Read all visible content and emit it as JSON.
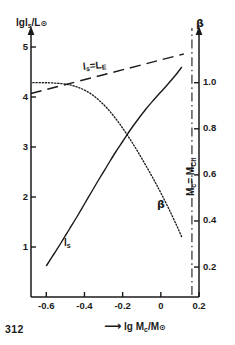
{
  "page": {
    "number": "312"
  },
  "axes": {
    "left": {
      "title_parts": {
        "lg": "lg",
        "l": "l",
        "sub": "s",
        "slash": "/L",
        "sun": "⊙"
      },
      "title": "lg ls/L⊙",
      "ticks": [
        1,
        2,
        3,
        4,
        5
      ],
      "tick_labels": [
        "1",
        "2",
        "3",
        "4",
        "5"
      ],
      "range": [
        0,
        5.3
      ]
    },
    "bottom": {
      "arrow": "⟶",
      "title_parts": {
        "lg": "lg M",
        "sub": "c",
        "slash": "/M",
        "sun": "⊙"
      },
      "title": "⟶ lg Mc/M⊙",
      "ticks": [
        -0.6,
        -0.4,
        -0.2,
        0,
        0.2
      ],
      "tick_labels": [
        "-0.6",
        "-0.4",
        "-0.2",
        "0",
        "0.2"
      ],
      "range": [
        -0.68,
        0.2
      ]
    },
    "right": {
      "title": "β",
      "ticks": [
        0.2,
        0.4,
        0.6,
        0.8,
        1.0
      ],
      "tick_labels": [
        "0.2",
        "0.4",
        "0.6",
        "0.8",
        "1.0"
      ],
      "range": [
        0.07,
        1.22
      ]
    }
  },
  "annotations": {
    "eddington": {
      "text": "lₛ = Lₑ",
      "parts": {
        "l": "l",
        "sub1": "s",
        "eq": "=L",
        "sub2": "E"
      }
    },
    "chandrasekhar": {
      "text": "Mᴄ = Mᴄʜ",
      "parts": {
        "m1": "M",
        "sub1": "c",
        "eq": "= M",
        "sub2": "Ch"
      }
    },
    "curve_ls": {
      "text": "lₛ",
      "parts": {
        "l": "l",
        "sub": "s"
      }
    },
    "curve_beta": {
      "text": "β"
    }
  },
  "chart_data": {
    "type": "line",
    "title": "",
    "xlabel": "lg Mc/M⊙",
    "ylabel": "lg ls/L⊙",
    "y2label": "β",
    "xlim": [
      -0.68,
      0.2
    ],
    "ylim": [
      0,
      5.3
    ],
    "y2lim": [
      0.07,
      1.22
    ],
    "grid": false,
    "legend": "none",
    "series": [
      {
        "name": "ls",
        "label": "lₛ",
        "axis": "left",
        "style": "solid",
        "color": "#1a1a1a",
        "x": [
          -0.6,
          -0.56,
          -0.52,
          -0.48,
          -0.44,
          -0.4,
          -0.36,
          -0.32,
          -0.28,
          -0.24,
          -0.2,
          -0.16,
          -0.12,
          -0.08,
          -0.04,
          0.0,
          0.04,
          0.08,
          0.11
        ],
        "y": [
          0.62,
          0.86,
          1.1,
          1.35,
          1.6,
          1.86,
          2.12,
          2.38,
          2.63,
          2.88,
          3.11,
          3.34,
          3.55,
          3.75,
          3.93,
          4.1,
          4.27,
          4.45,
          4.6
        ]
      },
      {
        "name": "beta",
        "label": "β",
        "axis": "right",
        "style": "dotted",
        "color": "#1a1a1a",
        "x": [
          -0.67,
          -0.62,
          -0.57,
          -0.52,
          -0.48,
          -0.44,
          -0.4,
          -0.36,
          -0.32,
          -0.28,
          -0.24,
          -0.2,
          -0.16,
          -0.12,
          -0.08,
          -0.04,
          0.0,
          0.04,
          0.08,
          0.11
        ],
        "y": [
          1.0,
          1.0,
          0.999,
          0.996,
          0.991,
          0.982,
          0.968,
          0.948,
          0.921,
          0.888,
          0.848,
          0.803,
          0.753,
          0.7,
          0.643,
          0.584,
          0.522,
          0.456,
          0.386,
          0.33
        ]
      },
      {
        "name": "eddington-limit",
        "label": "lₛ = Lₑ",
        "axis": "left",
        "style": "dashed",
        "color": "#1a1a1a",
        "x": [
          -0.68,
          0.12
        ],
        "y": [
          4.07,
          4.86
        ]
      },
      {
        "name": "chandrasekhar-mass",
        "label": "Mᴄ = Mᴄʜ",
        "axis": "vertical",
        "style": "dash-dot",
        "color": "#1a1a1a",
        "x": 0.163
      }
    ]
  }
}
